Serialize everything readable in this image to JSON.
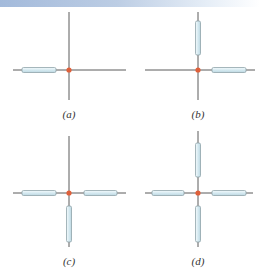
{
  "figure": {
    "colors": {
      "axis_line": "#5a5a5a",
      "rod_fill_light": "#eef7fa",
      "rod_fill_dark": "#c9e1ea",
      "rod_outline": "#8fa3aa",
      "charge_dot": "#e0603a",
      "top_band_start": "#a3badb"
    },
    "panels": [
      {
        "id": "a",
        "label": "(a)",
        "rods": [
          "left"
        ]
      },
      {
        "id": "b",
        "label": "(b)",
        "rods": [
          "up",
          "right"
        ]
      },
      {
        "id": "c",
        "label": "(c)",
        "rods": [
          "left",
          "right",
          "down"
        ]
      },
      {
        "id": "d",
        "label": "(d)",
        "rods": [
          "up",
          "left",
          "right",
          "down"
        ]
      }
    ]
  }
}
